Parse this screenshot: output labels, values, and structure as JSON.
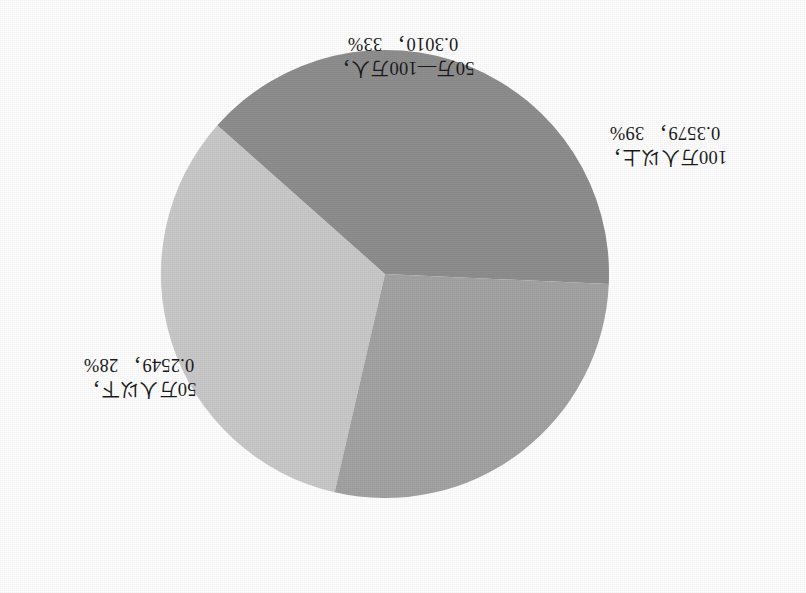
{
  "chart_data": {
    "type": "pie",
    "title": "",
    "subtitle": "",
    "xlabel": "",
    "ylabel": "",
    "grid": false,
    "legend_position": "none",
    "label_format": "name, value, percent",
    "orientation_note": "figure rendered upside-down (rotated 180 degrees) as in scanned original",
    "categories": [
      "50万—100万人",
      "100万人以上",
      "50万人以下"
    ],
    "values": [
      0.301,
      0.3579,
      0.2549
    ],
    "percents": [
      33,
      28.1,
      39
    ],
    "percent_labels": [
      "33%",
      "39%",
      "28%"
    ],
    "colors": [
      "#c9c9c9",
      "#8e8e8e",
      "#a3a3a3"
    ],
    "slices": [
      {
        "name": "50万—100万人",
        "name_line": "50万—100万人，",
        "value": 0.301,
        "value_text": "0.3010",
        "percent_text": "33%",
        "value_line": "0.3010， 33%",
        "color": "#c9c9c9",
        "start_angle": -77,
        "end_angle": 41
      },
      {
        "name": "100万人以上",
        "name_line": "100万人以上，",
        "value": 0.3579,
        "value_text": "0.3579",
        "percent_text": "39%",
        "value_line": "0.3579， 39%",
        "color": "#8e8e8e",
        "start_angle": 41,
        "end_angle": 181
      },
      {
        "name": "50万人以下",
        "name_line": "50万人以下，",
        "value": 0.2549,
        "value_text": "0.2549",
        "percent_text": "28%",
        "value_line": "0.2549， 28%",
        "color": "#a3a3a3",
        "start_angle": 181,
        "end_angle": 283
      }
    ]
  },
  "figure": {
    "background_color": "#ffffff",
    "label_text_color": "#1a1a1a"
  }
}
